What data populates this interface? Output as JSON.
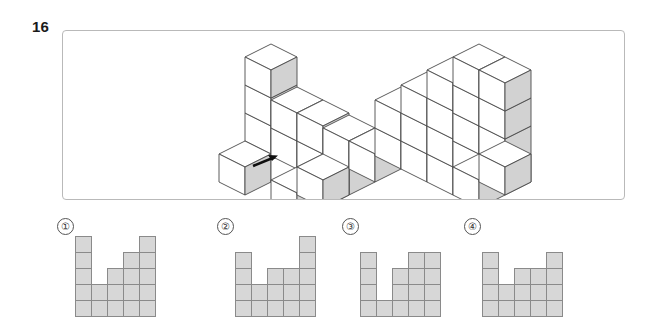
{
  "question": {
    "number": "16"
  },
  "figure_panel": {
    "name": "isometric-cube-figure",
    "arrow": {
      "name": "view-direction-arrow",
      "direction": "up-right"
    },
    "colors": {
      "cube_top": "#ffffff",
      "cube_left": "#ffffff",
      "cube_right": "#d2d2d2",
      "cube_outline": "#4a4a4a",
      "panel_border": "#b9b9b9"
    }
  },
  "options": [
    {
      "label": "①",
      "name": "option-1",
      "column_heights": [
        5,
        2,
        3,
        4,
        5
      ]
    },
    {
      "label": "②",
      "name": "option-2",
      "column_heights": [
        4,
        2,
        3,
        3,
        5
      ]
    },
    {
      "label": "③",
      "name": "option-3",
      "column_heights": [
        4,
        1,
        3,
        4,
        4
      ]
    },
    {
      "label": "④",
      "name": "option-4",
      "column_heights": [
        4,
        2,
        3,
        3,
        4
      ]
    }
  ],
  "option_grid_style": {
    "cell_fill": "#d7d7d7",
    "cell_border": "#8a8a8a",
    "cell_size_px": 17
  }
}
